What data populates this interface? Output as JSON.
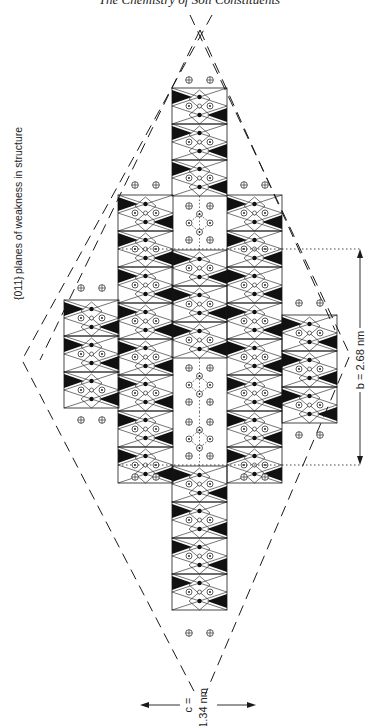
{
  "header": {
    "page_number": "22",
    "running_title": "The Chemistry of Soil Constituents"
  },
  "figure": {
    "planes_label_hkl": "{011}",
    "planes_label_text": "planes of weakness in structure",
    "b_label": "b = 2.68 nm",
    "c_label_top": "c =",
    "c_label_bottom": "1.34 nm",
    "colors": {
      "ink": "#1a1a1a",
      "fill_dark": "#111111",
      "background": "#ffffff"
    },
    "columns": [
      {
        "id": "far-left",
        "x": 64,
        "width": 54,
        "y_top": 300,
        "y_bottom": 410,
        "modules": 3
      },
      {
        "id": "left",
        "x": 118,
        "width": 54,
        "y_top": 195,
        "y_bottom": 465,
        "modules": 7
      },
      {
        "id": "center",
        "x": 172,
        "width": 55,
        "y_top": 88,
        "y_bottom": 625,
        "modules": 15
      },
      {
        "id": "right",
        "x": 227,
        "width": 55,
        "y_top": 195,
        "y_bottom": 465,
        "modules": 7
      },
      {
        "id": "far-right",
        "x": 282,
        "width": 53,
        "y_top": 315,
        "y_bottom": 410,
        "modules": 3
      }
    ]
  }
}
